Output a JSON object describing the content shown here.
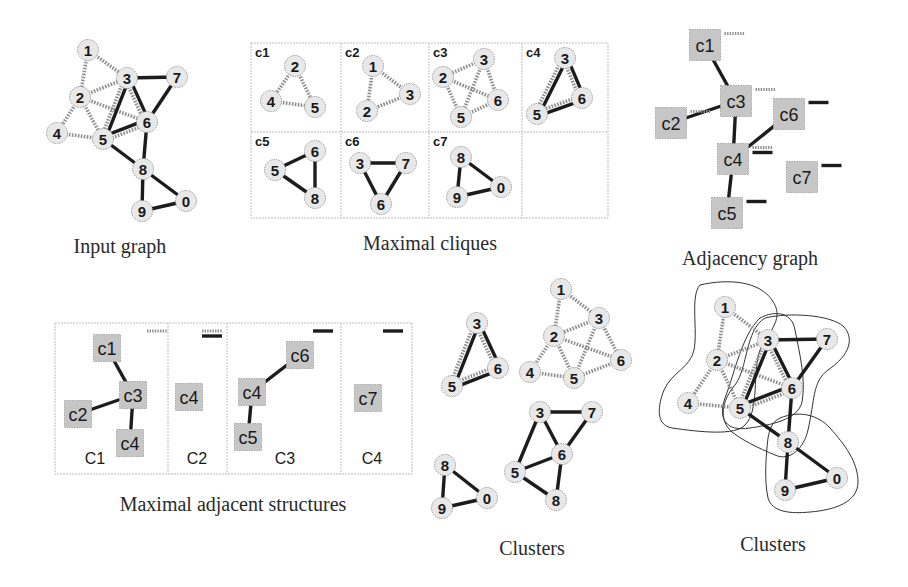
{
  "colors": {
    "node_fill": "#e8e8e8",
    "box_fill": "#c6c6c6",
    "solid_edge": "#1c1c1c",
    "dashed_edge": "#8e8e8e"
  },
  "input_graph": {
    "caption": "Input graph",
    "caption_pos": [
      120,
      253
    ],
    "nodes": [
      {
        "id": "1",
        "x": 88,
        "y": 50
      },
      {
        "id": "3",
        "x": 127,
        "y": 78
      },
      {
        "id": "7",
        "x": 177,
        "y": 77
      },
      {
        "id": "2",
        "x": 80,
        "y": 97
      },
      {
        "id": "6",
        "x": 147,
        "y": 122
      },
      {
        "id": "4",
        "x": 57,
        "y": 133
      },
      {
        "id": "5",
        "x": 103,
        "y": 139
      },
      {
        "id": "8",
        "x": 143,
        "y": 169
      },
      {
        "id": "0",
        "x": 186,
        "y": 201
      },
      {
        "id": "9",
        "x": 142,
        "y": 211
      }
    ],
    "edges": [
      {
        "a": "1",
        "b": "2",
        "style": "dashed"
      },
      {
        "a": "1",
        "b": "3",
        "style": "dashed"
      },
      {
        "a": "2",
        "b": "3",
        "style": "dashed"
      },
      {
        "a": "2",
        "b": "4",
        "style": "dashed"
      },
      {
        "a": "2",
        "b": "5",
        "style": "dashed"
      },
      {
        "a": "2",
        "b": "6",
        "style": "dashed"
      },
      {
        "a": "4",
        "b": "5",
        "style": "dashed"
      },
      {
        "a": "3",
        "b": "5",
        "style": "both"
      },
      {
        "a": "3",
        "b": "6",
        "style": "both"
      },
      {
        "a": "5",
        "b": "6",
        "style": "both"
      },
      {
        "a": "3",
        "b": "7",
        "style": "solid"
      },
      {
        "a": "6",
        "b": "7",
        "style": "solid"
      },
      {
        "a": "5",
        "b": "8",
        "style": "solid"
      },
      {
        "a": "6",
        "b": "8",
        "style": "solid"
      },
      {
        "a": "8",
        "b": "9",
        "style": "solid"
      },
      {
        "a": "8",
        "b": "0",
        "style": "solid"
      },
      {
        "a": "9",
        "b": "0",
        "style": "solid"
      }
    ]
  },
  "maximal_cliques": {
    "caption": "Maximal cliques",
    "caption_pos": [
      430,
      250
    ],
    "grid": {
      "x": [
        251,
        341,
        429,
        522,
        608
      ],
      "y": [
        43,
        132,
        218
      ]
    },
    "cells": [
      {
        "label": "c1",
        "col": 0,
        "row": 0,
        "nodes": [
          {
            "id": "2",
            "x": 295,
            "y": 66
          },
          {
            "id": "4",
            "x": 271,
            "y": 101
          },
          {
            "id": "5",
            "x": 315,
            "y": 107
          }
        ],
        "edges": [
          {
            "a": 0,
            "b": 1,
            "style": "dashed"
          },
          {
            "a": 0,
            "b": 2,
            "style": "dashed"
          },
          {
            "a": 1,
            "b": 2,
            "style": "dashed"
          }
        ]
      },
      {
        "label": "c2",
        "col": 1,
        "row": 0,
        "nodes": [
          {
            "id": "1",
            "x": 373,
            "y": 66
          },
          {
            "id": "3",
            "x": 410,
            "y": 94
          },
          {
            "id": "2",
            "x": 367,
            "y": 111
          }
        ],
        "edges": [
          {
            "a": 0,
            "b": 1,
            "style": "dashed"
          },
          {
            "a": 0,
            "b": 2,
            "style": "dashed"
          },
          {
            "a": 1,
            "b": 2,
            "style": "dashed"
          }
        ]
      },
      {
        "label": "c3",
        "col": 2,
        "row": 0,
        "nodes": [
          {
            "id": "3",
            "x": 484,
            "y": 59
          },
          {
            "id": "2",
            "x": 443,
            "y": 77
          },
          {
            "id": "6",
            "x": 498,
            "y": 100
          },
          {
            "id": "5",
            "x": 461,
            "y": 117
          }
        ],
        "edges": [
          {
            "a": 0,
            "b": 1,
            "style": "dashed"
          },
          {
            "a": 0,
            "b": 2,
            "style": "dashed"
          },
          {
            "a": 0,
            "b": 3,
            "style": "dashed"
          },
          {
            "a": 1,
            "b": 2,
            "style": "dashed"
          },
          {
            "a": 1,
            "b": 3,
            "style": "dashed"
          },
          {
            "a": 2,
            "b": 3,
            "style": "dashed"
          }
        ]
      },
      {
        "label": "c4",
        "col": 3,
        "row": 0,
        "nodes": [
          {
            "id": "3",
            "x": 565,
            "y": 58
          },
          {
            "id": "6",
            "x": 582,
            "y": 98
          },
          {
            "id": "5",
            "x": 537,
            "y": 114
          }
        ],
        "edges": [
          {
            "a": 0,
            "b": 1,
            "style": "both"
          },
          {
            "a": 0,
            "b": 2,
            "style": "both"
          },
          {
            "a": 1,
            "b": 2,
            "style": "both"
          }
        ]
      },
      {
        "label": "c5",
        "col": 0,
        "row": 1,
        "nodes": [
          {
            "id": "6",
            "x": 315,
            "y": 151
          },
          {
            "id": "5",
            "x": 275,
            "y": 170
          },
          {
            "id": "8",
            "x": 315,
            "y": 198
          }
        ],
        "edges": [
          {
            "a": 0,
            "b": 1,
            "style": "solid"
          },
          {
            "a": 0,
            "b": 2,
            "style": "solid"
          },
          {
            "a": 1,
            "b": 2,
            "style": "solid"
          }
        ]
      },
      {
        "label": "c6",
        "col": 1,
        "row": 1,
        "nodes": [
          {
            "id": "3",
            "x": 360,
            "y": 163
          },
          {
            "id": "7",
            "x": 406,
            "y": 163
          },
          {
            "id": "6",
            "x": 381,
            "y": 204
          }
        ],
        "edges": [
          {
            "a": 0,
            "b": 1,
            "style": "solid"
          },
          {
            "a": 0,
            "b": 2,
            "style": "solid"
          },
          {
            "a": 1,
            "b": 2,
            "style": "solid"
          }
        ]
      },
      {
        "label": "c7",
        "col": 2,
        "row": 1,
        "nodes": [
          {
            "id": "8",
            "x": 461,
            "y": 157
          },
          {
            "id": "0",
            "x": 501,
            "y": 187
          },
          {
            "id": "9",
            "x": 457,
            "y": 197
          }
        ],
        "edges": [
          {
            "a": 0,
            "b": 1,
            "style": "solid"
          },
          {
            "a": 0,
            "b": 2,
            "style": "solid"
          },
          {
            "a": 1,
            "b": 2,
            "style": "solid"
          }
        ]
      }
    ]
  },
  "adjacency_graph": {
    "caption": "Adjacency graph",
    "caption_pos": [
      750,
      265
    ],
    "box_size": 31,
    "boxes": [
      {
        "id": "c1",
        "x": 705,
        "y": 45,
        "markers": [
          "dashed"
        ]
      },
      {
        "id": "c3",
        "x": 736,
        "y": 101,
        "markers": [
          "dashed"
        ]
      },
      {
        "id": "c2",
        "x": 671,
        "y": 123,
        "markers": [
          "dashed"
        ]
      },
      {
        "id": "c6",
        "x": 789,
        "y": 114,
        "markers": [
          "solid"
        ]
      },
      {
        "id": "c4",
        "x": 733,
        "y": 159,
        "markers": [
          "dashed",
          "solid"
        ]
      },
      {
        "id": "c7",
        "x": 802,
        "y": 177,
        "markers": [
          "solid"
        ]
      },
      {
        "id": "c5",
        "x": 727,
        "y": 213,
        "markers": [
          "solid"
        ]
      }
    ],
    "edges": [
      {
        "a": "c1",
        "b": "c3"
      },
      {
        "a": "c2",
        "b": "c3"
      },
      {
        "a": "c3",
        "b": "c4"
      },
      {
        "a": "c4",
        "b": "c6"
      },
      {
        "a": "c4",
        "b": "c5"
      }
    ]
  },
  "maximal_adjacent_structures": {
    "caption": "Maximal adjacent structures",
    "caption_pos": [
      233,
      511
    ],
    "frame": {
      "x": [
        55,
        168,
        227,
        341,
        412
      ],
      "top": 323,
      "bottom": 474
    },
    "box_size": 27,
    "panels": [
      {
        "label": "C1",
        "label_pos": [
          95,
          464
        ],
        "markers": [
          "dashed"
        ],
        "marker_pos": [
          157,
          331
        ],
        "boxes": [
          {
            "id": "c1",
            "x": 107,
            "y": 348
          },
          {
            "id": "c3",
            "x": 133,
            "y": 395
          },
          {
            "id": "c2",
            "x": 78,
            "y": 414
          },
          {
            "id": "c4",
            "x": 130,
            "y": 443
          }
        ],
        "edges": [
          {
            "a": "c1",
            "b": "c3"
          },
          {
            "a": "c2",
            "b": "c3"
          },
          {
            "a": "c3",
            "b": "c4"
          }
        ]
      },
      {
        "label": "C2",
        "label_pos": [
          197,
          464
        ],
        "markers": [
          "dashed",
          "solid"
        ],
        "marker_pos": [
          212,
          331
        ],
        "boxes": [
          {
            "id": "c4",
            "x": 189,
            "y": 397
          }
        ],
        "edges": []
      },
      {
        "label": "C3",
        "label_pos": [
          285,
          464
        ],
        "markers": [
          "solid"
        ],
        "marker_pos": [
          323,
          331
        ],
        "boxes": [
          {
            "id": "c6",
            "x": 300,
            "y": 355
          },
          {
            "id": "c4",
            "x": 252,
            "y": 392
          },
          {
            "id": "c5",
            "x": 248,
            "y": 437
          }
        ],
        "edges": [
          {
            "a": "c4",
            "b": "c6"
          },
          {
            "a": "c4",
            "b": "c5"
          }
        ]
      },
      {
        "label": "C4",
        "label_pos": [
          372,
          464
        ],
        "markers": [
          "solid"
        ],
        "marker_pos": [
          393,
          331
        ],
        "boxes": [
          {
            "id": "c7",
            "x": 368,
            "y": 398
          }
        ],
        "edges": []
      }
    ]
  },
  "clusters_separate": {
    "caption": "Clusters",
    "caption_pos": [
      532,
      555
    ],
    "groups": [
      {
        "name": "cluster-356",
        "nodes": [
          {
            "id": "3",
            "x": 477,
            "y": 323
          },
          {
            "id": "6",
            "x": 498,
            "y": 368
          },
          {
            "id": "5",
            "x": 452,
            "y": 386
          }
        ],
        "edges": [
          {
            "a": 0,
            "b": 1,
            "style": "both"
          },
          {
            "a": 0,
            "b": 2,
            "style": "both"
          },
          {
            "a": 1,
            "b": 2,
            "style": "both"
          }
        ]
      },
      {
        "name": "cluster-123456",
        "nodes": [
          {
            "id": "1",
            "x": 561,
            "y": 289
          },
          {
            "id": "3",
            "x": 599,
            "y": 318
          },
          {
            "id": "2",
            "x": 554,
            "y": 336
          },
          {
            "id": "6",
            "x": 621,
            "y": 360
          },
          {
            "id": "4",
            "x": 530,
            "y": 372
          },
          {
            "id": "5",
            "x": 574,
            "y": 378
          }
        ],
        "edges": [
          {
            "a": 0,
            "b": 1,
            "style": "dashed"
          },
          {
            "a": 0,
            "b": 2,
            "style": "dashed"
          },
          {
            "a": 1,
            "b": 2,
            "style": "dashed"
          },
          {
            "a": 1,
            "b": 3,
            "style": "dashed"
          },
          {
            "a": 1,
            "b": 5,
            "style": "dashed"
          },
          {
            "a": 2,
            "b": 3,
            "style": "dashed"
          },
          {
            "a": 2,
            "b": 4,
            "style": "dashed"
          },
          {
            "a": 2,
            "b": 5,
            "style": "dashed"
          },
          {
            "a": 4,
            "b": 5,
            "style": "dashed"
          },
          {
            "a": 3,
            "b": 5,
            "style": "dashed"
          }
        ]
      },
      {
        "name": "cluster-35678",
        "nodes": [
          {
            "id": "3",
            "x": 540,
            "y": 412
          },
          {
            "id": "7",
            "x": 592,
            "y": 412
          },
          {
            "id": "6",
            "x": 562,
            "y": 454
          },
          {
            "id": "5",
            "x": 515,
            "y": 472
          },
          {
            "id": "8",
            "x": 556,
            "y": 500
          }
        ],
        "edges": [
          {
            "a": 0,
            "b": 1,
            "style": "solid"
          },
          {
            "a": 0,
            "b": 2,
            "style": "solid"
          },
          {
            "a": 0,
            "b": 3,
            "style": "solid"
          },
          {
            "a": 1,
            "b": 2,
            "style": "solid"
          },
          {
            "a": 2,
            "b": 3,
            "style": "solid"
          },
          {
            "a": 2,
            "b": 4,
            "style": "solid"
          },
          {
            "a": 3,
            "b": 4,
            "style": "solid"
          }
        ]
      },
      {
        "name": "cluster-089",
        "nodes": [
          {
            "id": "8",
            "x": 445,
            "y": 465
          },
          {
            "id": "0",
            "x": 487,
            "y": 498
          },
          {
            "id": "9",
            "x": 442,
            "y": 508
          }
        ],
        "edges": [
          {
            "a": 0,
            "b": 1,
            "style": "solid"
          },
          {
            "a": 0,
            "b": 2,
            "style": "solid"
          },
          {
            "a": 1,
            "b": 2,
            "style": "solid"
          }
        ]
      }
    ]
  },
  "clusters_overlay": {
    "caption": "Clusters",
    "caption_pos": [
      773,
      551
    ],
    "nodes": [
      {
        "id": "1",
        "x": 725,
        "y": 307
      },
      {
        "id": "3",
        "x": 768,
        "y": 340
      },
      {
        "id": "7",
        "x": 827,
        "y": 339
      },
      {
        "id": "2",
        "x": 717,
        "y": 360
      },
      {
        "id": "6",
        "x": 792,
        "y": 388
      },
      {
        "id": "4",
        "x": 688,
        "y": 403
      },
      {
        "id": "5",
        "x": 740,
        "y": 408
      },
      {
        "id": "8",
        "x": 788,
        "y": 442
      },
      {
        "id": "0",
        "x": 837,
        "y": 478
      },
      {
        "id": "9",
        "x": 785,
        "y": 490
      }
    ],
    "edges": [
      {
        "a": "1",
        "b": "2",
        "style": "dashed"
      },
      {
        "a": "1",
        "b": "3",
        "style": "dashed"
      },
      {
        "a": "2",
        "b": "3",
        "style": "dashed"
      },
      {
        "a": "2",
        "b": "4",
        "style": "dashed"
      },
      {
        "a": "2",
        "b": "5",
        "style": "dashed"
      },
      {
        "a": "2",
        "b": "6",
        "style": "dashed"
      },
      {
        "a": "4",
        "b": "5",
        "style": "dashed"
      },
      {
        "a": "3",
        "b": "5",
        "style": "both"
      },
      {
        "a": "3",
        "b": "6",
        "style": "both"
      },
      {
        "a": "5",
        "b": "6",
        "style": "both"
      },
      {
        "a": "3",
        "b": "7",
        "style": "solid"
      },
      {
        "a": "6",
        "b": "7",
        "style": "solid"
      },
      {
        "a": "5",
        "b": "8",
        "style": "solid"
      },
      {
        "a": "6",
        "b": "8",
        "style": "solid"
      },
      {
        "a": "8",
        "b": "9",
        "style": "solid"
      },
      {
        "a": "8",
        "b": "0",
        "style": "solid"
      },
      {
        "a": "9",
        "b": "0",
        "style": "solid"
      }
    ],
    "hulls": [
      {
        "name": "hull-C1",
        "d": "M 700 285 C 730 278 760 282 772 300 C 785 318 770 330 760 350 C 752 372 760 410 745 425 C 735 436 700 432 672 428 C 655 425 658 405 664 390 C 672 372 690 368 694 350 C 698 330 690 296 700 285 Z"
      },
      {
        "name": "hull-C2",
        "d": "M 760 318 C 775 310 792 312 795 330 C 800 355 806 380 802 402 C 798 420 770 425 750 428 C 725 432 718 418 725 398 C 735 372 742 335 760 318 Z"
      },
      {
        "name": "hull-C3",
        "d": "M 765 318 C 790 312 830 315 843 326 C 855 338 850 355 828 370 C 812 382 815 400 808 430 C 804 448 790 462 775 455 C 758 448 742 440 732 432 C 718 420 722 400 735 385 C 748 368 745 330 765 318 Z"
      },
      {
        "name": "hull-C4",
        "d": "M 780 418 C 800 410 818 415 830 428 C 845 445 858 462 858 482 C 858 502 835 510 810 512 C 790 514 772 512 768 498 C 764 480 766 455 768 438 C 770 428 772 422 780 418 Z"
      }
    ]
  }
}
